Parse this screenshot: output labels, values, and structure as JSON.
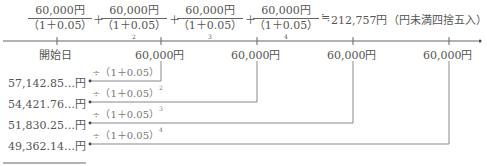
{
  "formula": {
    "terms": [
      {
        "numerator": "60,000円",
        "denominator": "（1＋0.05）",
        "exponent": ""
      },
      {
        "numerator": "60,000円",
        "denominator": "（1＋0.05）",
        "exponent": "2"
      },
      {
        "numerator": "60,000円",
        "denominator": "（1＋0.05）",
        "exponent": "3"
      },
      {
        "numerator": "60,000円",
        "denominator": "（1＋0.05）",
        "exponent": "4"
      }
    ],
    "plus": "＋",
    "approx": "≒",
    "result": "212,757円",
    "note": "（円未満四捨五入）"
  },
  "timeline": {
    "start_label": "開始日",
    "payments": [
      "60,000円",
      "60,000円",
      "60,000円",
      "60,000円"
    ]
  },
  "discounts": [
    {
      "divisor": "÷（1＋0.05）",
      "exponent": "",
      "value": "57,142.85…円"
    },
    {
      "divisor": "÷（1＋0.05）",
      "exponent": "2",
      "value": "54,421.76…円"
    },
    {
      "divisor": "÷（1＋0.05）",
      "exponent": "3",
      "value": "51,830.25…円"
    },
    {
      "divisor": "÷（1＋0.05）",
      "exponent": "4",
      "value": "49,362.14…円"
    }
  ],
  "colors": {
    "line": "#777777",
    "text": "#555555"
  }
}
